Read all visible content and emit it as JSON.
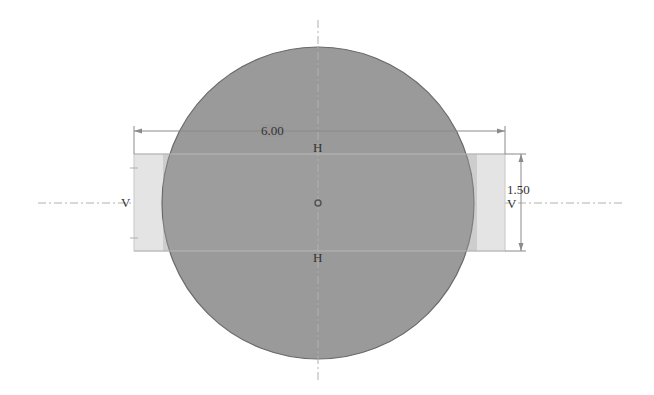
{
  "sketch": {
    "colors": {
      "background": "#ffffff",
      "circle_fill": "#979797",
      "circle_stroke": "#6a6a6a",
      "rect_fill": "#e4e4e4",
      "rect_stroke": "#c8c8c8",
      "centerline": "#b0b0b0",
      "dimension_line": "#8a8a8a",
      "text": "#333333"
    },
    "circle": {
      "cx": 318,
      "cy": 203,
      "r": 156
    },
    "rectangle": {
      "x": 134,
      "y": 154,
      "width": 371,
      "height": 97
    },
    "centerlines": {
      "horizontal": {
        "x1": 38,
        "x2": 625,
        "y": 203
      },
      "vertical": {
        "x": 318,
        "y1": 20,
        "y2": 383
      }
    },
    "center_point": {
      "x": 318,
      "y": 203
    },
    "dimensions": {
      "width": {
        "value": "6.00",
        "y": 131,
        "x1": 134,
        "x2": 505
      },
      "height": {
        "value": "1.50",
        "x": 521,
        "y1": 154,
        "y2": 251
      }
    },
    "constraints": {
      "horizontal_top": "H",
      "horizontal_bottom": "H",
      "vertical_left": "V",
      "vertical_right": "V"
    }
  }
}
